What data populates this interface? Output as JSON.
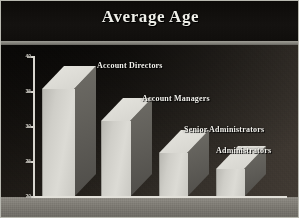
{
  "chart_data": {
    "type": "bar",
    "title": "Average Age",
    "xlabel": "",
    "ylabel": "",
    "ylim": [
      20,
      40
    ],
    "grid": false,
    "legend_position": "inline-above-bars",
    "style": "3d-isometric-bars",
    "categories": [
      "Account Directors",
      "Account Managers",
      "Senior Administrators",
      "Administrators"
    ],
    "values": [
      38,
      33,
      25.5,
      22
    ],
    "tick_labels": [
      "40",
      "35",
      "30",
      "25",
      "20"
    ],
    "tick_values": [
      40,
      35,
      30,
      25,
      20
    ],
    "annotations": [
      "Account Directors",
      "Account Managers",
      "Senior Administrators",
      "Administrators"
    ]
  },
  "colors": {
    "title_text": "#efefe9",
    "background_dark": "#16130f",
    "background_light": "#423b34",
    "bar_face": "#dcdbd5",
    "bar_side": "#5d5b56",
    "axis_line": "#e2e0d9",
    "floor": "#8d8a83",
    "label_text": "#f2f1ec",
    "divider": "#a9a8a0"
  },
  "axis": {
    "ticks": [
      {
        "label": "40",
        "top": 9,
        "value": 40
      },
      {
        "label": "35",
        "top": 44,
        "value": 35
      },
      {
        "label": "30",
        "top": 79,
        "value": 30
      },
      {
        "label": "25",
        "top": 114,
        "value": 25
      },
      {
        "label": "20",
        "top": 149,
        "value": 20
      }
    ]
  },
  "bars": [
    {
      "name": "Account Directors",
      "value": 38,
      "label_left": 96,
      "label_top": 16,
      "left": 41,
      "top": 44,
      "width": 32,
      "height": 108,
      "depth_x": 22,
      "depth_y": 23
    },
    {
      "name": "Account Managers",
      "value": 33,
      "label_left": 141,
      "label_top": 49,
      "left": 100,
      "top": 76,
      "width": 29,
      "height": 76,
      "depth_x": 22,
      "depth_y": 23
    },
    {
      "name": "Senior Administrators",
      "value": 25.5,
      "label_left": 183,
      "label_top": 80,
      "left": 158,
      "top": 108,
      "width": 28,
      "height": 44,
      "depth_x": 22,
      "depth_y": 23
    },
    {
      "name": "Administrators",
      "value": 22,
      "label_left": 215,
      "label_top": 101,
      "left": 215,
      "top": 124,
      "width": 28,
      "height": 28,
      "depth_x": 22,
      "depth_y": 23
    }
  ]
}
